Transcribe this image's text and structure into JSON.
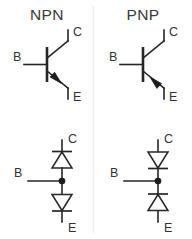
{
  "figure": {
    "background_color": "#ffffff",
    "line_color": "#262626",
    "title_color": "#3a3a3a",
    "divider_color": "#ececec",
    "columns": [
      {
        "id": "npn",
        "title": "NPN",
        "symbol": {
          "type": "bipolar-junction-transistor",
          "emitter_arrow_direction": "outward-from-base",
          "terminals": {
            "base": "B",
            "collector": "C",
            "emitter": "E"
          }
        },
        "equivalent": {
          "type": "two-diode-model",
          "description": "back-to-back diodes with common cathode at base",
          "upper_diode_direction": "points-up-toward-collector",
          "lower_diode_direction": "points-down-toward-emitter",
          "terminals": {
            "base": "B",
            "collector": "C",
            "emitter": "E"
          }
        }
      },
      {
        "id": "pnp",
        "title": "PNP",
        "symbol": {
          "type": "bipolar-junction-transistor",
          "emitter_arrow_direction": "inward-toward-base",
          "terminals": {
            "base": "B",
            "collector": "C",
            "emitter": "E"
          }
        },
        "equivalent": {
          "type": "two-diode-model",
          "description": "back-to-back diodes with common anode at base",
          "upper_diode_direction": "points-down-toward-base",
          "lower_diode_direction": "points-up-toward-base",
          "terminals": {
            "base": "B",
            "collector": "C",
            "emitter": "E"
          }
        }
      }
    ]
  }
}
